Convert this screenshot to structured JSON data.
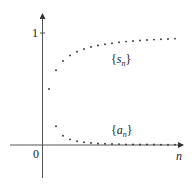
{
  "chart_data": {
    "type": "scatter",
    "title": "",
    "xlabel": "n",
    "ylabel": "",
    "x_tick_labels": [
      "0"
    ],
    "y_tick_labels": [
      "1"
    ],
    "grid": false,
    "legend": "inline labels",
    "xlim": [
      0,
      20
    ],
    "ylim": [
      -0.35,
      1.18
    ],
    "x": [
      1,
      2,
      3,
      4,
      5,
      6,
      7,
      8,
      9,
      10,
      11,
      12,
      13,
      14,
      15,
      16,
      17,
      18,
      19
    ],
    "series": [
      {
        "name": "{s_n}",
        "label_display": "{sₙ}",
        "values": [
          0.5,
          0.667,
          0.75,
          0.8,
          0.833,
          0.857,
          0.875,
          0.889,
          0.9,
          0.909,
          0.917,
          0.923,
          0.929,
          0.933,
          0.938,
          0.941,
          0.944,
          0.947,
          0.95
        ]
      },
      {
        "name": "{a_n}",
        "label_display": "{aₙ}",
        "x": [
          2,
          3,
          4,
          5,
          6,
          7,
          8,
          9,
          10,
          11,
          12,
          13,
          14,
          15,
          16,
          17,
          18,
          19
        ],
        "values": [
          0.167,
          0.083,
          0.05,
          0.033,
          0.024,
          0.018,
          0.014,
          0.011,
          0.009,
          0.008,
          0.006,
          0.005,
          0.005,
          0.004,
          0.004,
          0.003,
          0.003,
          0.003
        ]
      }
    ],
    "annotations": [
      {
        "text": "{sₙ}",
        "near": "upper curve"
      },
      {
        "text": "{aₙ}",
        "near": "lower curve"
      }
    ]
  },
  "labels": {
    "y_tick_1": "1",
    "origin": "0",
    "x_axis": "n",
    "s_label_open": "{",
    "s_label_var": "s",
    "s_label_sub": "n",
    "s_label_close": "}",
    "a_label_open": "{",
    "a_label_var": "a",
    "a_label_sub": "n",
    "a_label_close": "}"
  }
}
